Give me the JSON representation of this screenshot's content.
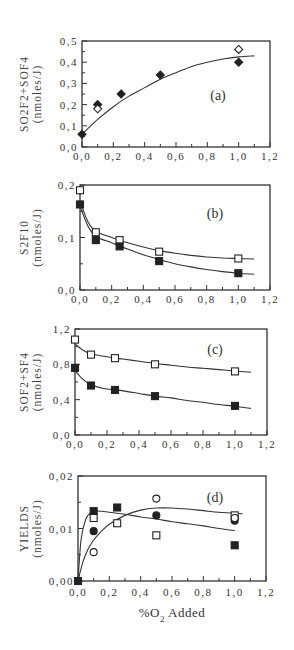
{
  "chart_data": [
    {
      "type": "scatter",
      "panel_label": "(a)",
      "ylabel_line1": "SO2F2+SOF4",
      "ylabel_line2": "(nmoles/J)",
      "xlabel": "",
      "xlim": [
        0,
        1.2
      ],
      "ylim": [
        0,
        0.5
      ],
      "x_ticks": [
        "0,0",
        "0,2",
        "0,4",
        "0,6",
        "0,8",
        "1,0",
        "1,2"
      ],
      "y_ticks": [
        "0,0",
        "0,1",
        "0,2",
        "0,3",
        "0,4",
        "0,5"
      ],
      "y_tick_values": [
        0,
        0.1,
        0.2,
        0.3,
        0.4,
        0.5
      ],
      "series": [
        {
          "name": "filled diamonds",
          "marker": "diamond-filled",
          "x": [
            0,
            0.1,
            0.25,
            0.5,
            1.0
          ],
          "y": [
            0.06,
            0.2,
            0.25,
            0.34,
            0.4
          ]
        },
        {
          "name": "open diamonds",
          "marker": "diamond-open",
          "x": [
            0.1,
            1.0
          ],
          "y": [
            0.18,
            0.46
          ]
        }
      ],
      "curves": [
        {
          "x": [
            0,
            0.1,
            0.2,
            0.3,
            0.4,
            0.5,
            0.6,
            0.7,
            0.8,
            0.9,
            1.0,
            1.1
          ],
          "y": [
            0.06,
            0.13,
            0.19,
            0.24,
            0.28,
            0.32,
            0.35,
            0.38,
            0.4,
            0.415,
            0.425,
            0.43
          ]
        }
      ],
      "grid": false
    },
    {
      "type": "line",
      "panel_label": "(b)",
      "ylabel_line1": "S2F10",
      "ylabel_line2": "(nmoles/J)",
      "xlabel": "",
      "xlim": [
        0,
        1.2
      ],
      "ylim": [
        0,
        0.2
      ],
      "x_ticks": [
        "0,0",
        "0,2",
        "0,4",
        "0,6",
        "0,8",
        "1,0",
        "1,2"
      ],
      "y_ticks": [
        "0,0",
        "0,1",
        "0,2"
      ],
      "y_tick_values": [
        0,
        0.1,
        0.2
      ],
      "series": [
        {
          "name": "open squares",
          "marker": "square-open",
          "x": [
            0,
            0.1,
            0.25,
            0.5,
            1.0
          ],
          "y": [
            0.19,
            0.11,
            0.095,
            0.073,
            0.06
          ]
        },
        {
          "name": "filled squares",
          "marker": "square-filled",
          "x": [
            0,
            0.1,
            0.25,
            0.5,
            1.0
          ],
          "y": [
            0.163,
            0.095,
            0.083,
            0.055,
            0.032
          ]
        }
      ],
      "curves": [
        {
          "x": [
            0,
            0.05,
            0.1,
            0.2,
            0.3,
            0.4,
            0.5,
            0.6,
            0.7,
            0.8,
            0.9,
            1.0,
            1.1
          ],
          "y": [
            0.17,
            0.13,
            0.112,
            0.1,
            0.09,
            0.082,
            0.075,
            0.07,
            0.066,
            0.063,
            0.061,
            0.06,
            0.059
          ]
        },
        {
          "x": [
            0,
            0.05,
            0.1,
            0.2,
            0.3,
            0.4,
            0.5,
            0.6,
            0.7,
            0.8,
            0.9,
            1.0,
            1.1
          ],
          "y": [
            0.16,
            0.122,
            0.102,
            0.09,
            0.078,
            0.067,
            0.058,
            0.05,
            0.044,
            0.039,
            0.035,
            0.032,
            0.03
          ]
        }
      ],
      "grid": false
    },
    {
      "type": "line",
      "panel_label": "(c)",
      "ylabel_line1": "SOF2+SF4",
      "ylabel_line2": "(nmoles/J)",
      "xlabel": "",
      "xlim": [
        0,
        1.2
      ],
      "ylim": [
        0,
        1.2
      ],
      "x_ticks": [
        "0,0",
        "0,2",
        "0,4",
        "0,6",
        "0,8",
        "1,0",
        "1,2"
      ],
      "y_ticks": [
        "0,0",
        "0,4",
        "0,8",
        "1,2"
      ],
      "y_tick_values": [
        0,
        0.4,
        0.8,
        1.2
      ],
      "series": [
        {
          "name": "open squares",
          "marker": "square-open",
          "x": [
            0,
            0.1,
            0.25,
            0.5,
            1.0
          ],
          "y": [
            1.08,
            0.91,
            0.87,
            0.8,
            0.72
          ]
        },
        {
          "name": "filled squares",
          "marker": "square-filled",
          "x": [
            0,
            0.1,
            0.25,
            0.5,
            1.0
          ],
          "y": [
            0.76,
            0.56,
            0.51,
            0.44,
            0.33
          ]
        }
      ],
      "curves": [
        {
          "x": [
            0,
            0.05,
            0.1,
            0.2,
            0.3,
            0.4,
            0.5,
            0.6,
            0.7,
            0.8,
            0.9,
            1.0,
            1.1
          ],
          "y": [
            1.03,
            0.96,
            0.92,
            0.885,
            0.86,
            0.835,
            0.81,
            0.79,
            0.77,
            0.755,
            0.74,
            0.725,
            0.71
          ]
        },
        {
          "x": [
            0,
            0.05,
            0.1,
            0.2,
            0.3,
            0.4,
            0.5,
            0.6,
            0.7,
            0.8,
            0.9,
            1.0,
            1.1
          ],
          "y": [
            0.73,
            0.63,
            0.57,
            0.52,
            0.5,
            0.47,
            0.44,
            0.42,
            0.39,
            0.37,
            0.345,
            0.325,
            0.3
          ]
        }
      ],
      "grid": false
    },
    {
      "type": "scatter",
      "panel_label": "(d)",
      "ylabel_line1": "YIELDS",
      "ylabel_line2": "(nmoles/J)",
      "xlabel": "%O2 Added",
      "xlim": [
        0,
        1.2
      ],
      "ylim": [
        0,
        0.02
      ],
      "x_ticks": [
        "0,0",
        "0,2",
        "0,4",
        "0,6",
        "0,8",
        "1,0",
        "1,2"
      ],
      "y_ticks": [
        "0,00",
        "0,01",
        "0,02"
      ],
      "y_tick_values": [
        0,
        0.01,
        0.02
      ],
      "series": [
        {
          "name": "filled squares",
          "marker": "square-filled",
          "x": [
            0,
            0.1,
            0.25,
            1.0
          ],
          "y": [
            0,
            0.0133,
            0.014,
            0.0068
          ]
        },
        {
          "name": "open squares",
          "marker": "square-open",
          "x": [
            0.1,
            0.25,
            0.5,
            1.0
          ],
          "y": [
            0.012,
            0.011,
            0.0087,
            0.0125
          ]
        },
        {
          "name": "filled circles",
          "marker": "circle-filled",
          "x": [
            0.1,
            0.5,
            1.0
          ],
          "y": [
            0.0095,
            0.0125,
            0.0115
          ]
        },
        {
          "name": "open circles",
          "marker": "circle-open",
          "x": [
            0.1,
            0.5,
            1.0
          ],
          "y": [
            0.0055,
            0.0157,
            0.012
          ]
        }
      ],
      "curves": [
        {
          "x": [
            0,
            0.02,
            0.05,
            0.08,
            0.1,
            0.15,
            0.2,
            0.3,
            0.4,
            0.5,
            0.6,
            0.7,
            0.8,
            0.9,
            1.0
          ],
          "y": [
            0,
            0.008,
            0.0118,
            0.013,
            0.0133,
            0.0133,
            0.0131,
            0.0127,
            0.0122,
            0.0118,
            0.0113,
            0.0109,
            0.0105,
            0.01,
            0.0096
          ]
        },
        {
          "x": [
            0,
            0.03,
            0.06,
            0.1,
            0.15,
            0.2,
            0.3,
            0.4,
            0.5,
            0.6,
            0.7,
            0.8,
            0.9,
            1.0,
            1.05
          ],
          "y": [
            0,
            0.0035,
            0.0058,
            0.0078,
            0.0095,
            0.0108,
            0.0125,
            0.0135,
            0.0139,
            0.0139,
            0.0137,
            0.0134,
            0.0131,
            0.0129,
            0.0128
          ]
        }
      ],
      "grid": false
    }
  ],
  "figure": {
    "xlabel_prefix": "%O",
    "xlabel_sub": "2",
    "xlabel_suffix": " Added"
  }
}
